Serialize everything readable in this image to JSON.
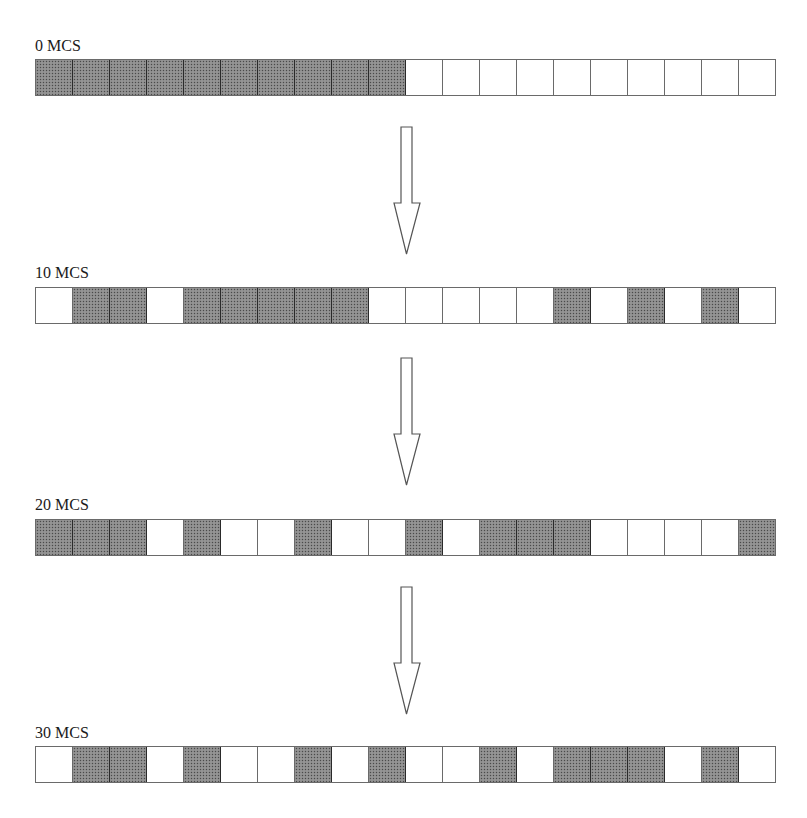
{
  "diagram": {
    "type": "lattice-evolution",
    "lattice_size": 20,
    "legend": {
      "occupied": "dark-hatched",
      "empty": "white"
    },
    "colors": {
      "occupied": "#8a8a8a",
      "empty": "#ffffff",
      "border": "#6a6a6a"
    },
    "snapshots": [
      {
        "label": "0 MCS",
        "cells": [
          1,
          1,
          1,
          1,
          1,
          1,
          1,
          1,
          1,
          1,
          0,
          0,
          0,
          0,
          0,
          0,
          0,
          0,
          0,
          0
        ]
      },
      {
        "label": "10 MCS",
        "cells": [
          0,
          1,
          1,
          0,
          1,
          1,
          1,
          1,
          1,
          0,
          0,
          0,
          0,
          0,
          1,
          0,
          1,
          0,
          1,
          0
        ]
      },
      {
        "label": "20 MCS",
        "cells": [
          1,
          1,
          1,
          0,
          1,
          0,
          0,
          1,
          0,
          0,
          1,
          0,
          1,
          1,
          1,
          0,
          0,
          0,
          0,
          1
        ]
      },
      {
        "label": "30 MCS",
        "cells": [
          0,
          1,
          1,
          0,
          1,
          0,
          0,
          1,
          0,
          1,
          0,
          0,
          1,
          0,
          1,
          1,
          1,
          0,
          1,
          0
        ]
      }
    ],
    "arrows": [
      {
        "from": "0 MCS",
        "to": "10 MCS",
        "icon": "down-arrow-icon"
      },
      {
        "from": "10 MCS",
        "to": "20 MCS",
        "icon": "down-arrow-icon"
      },
      {
        "from": "20 MCS",
        "to": "30 MCS",
        "icon": "down-arrow-icon"
      }
    ]
  }
}
